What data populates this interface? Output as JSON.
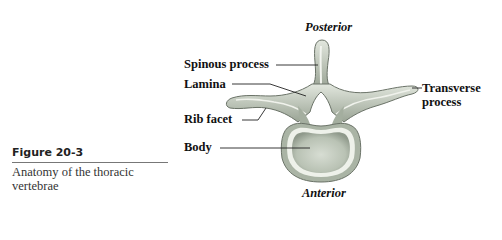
{
  "figure": {
    "number": "Figure 20-3",
    "caption": "Anatomy of the thoracic vertebrae",
    "orientation": {
      "top": "Posterior",
      "bottom": "Anterior"
    },
    "labels": {
      "spinous_process": "Spinous process",
      "lamina": "Lamina",
      "rib_facet": "Rib facet",
      "body": "Body",
      "transverse_process_line1": "Transverse",
      "transverse_process_line2": "process"
    },
    "colors": {
      "bone_fill": "#c9d2c4",
      "bone_shade": "#9fa99a",
      "bone_outline": "#6b7368",
      "leader_line": "#222222"
    }
  }
}
